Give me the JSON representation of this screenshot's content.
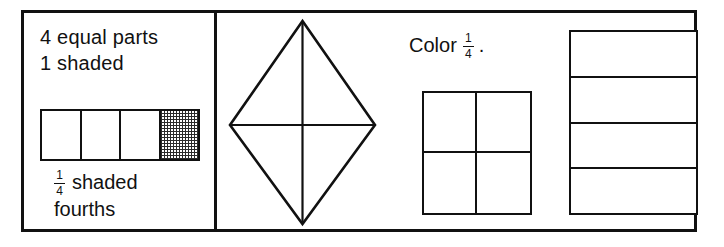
{
  "worksheet": {
    "title": "Fractions worksheet: fourths",
    "ink_color": "#111111",
    "paper_color": "#ffffff"
  },
  "example_panel": {
    "caption_equal_parts": "4 equal parts",
    "caption_shaded_count": "1 shaded",
    "shaded_label_text": "shaded",
    "fourths_label": "fourths",
    "fraction": {
      "numerator": "1",
      "denominator": "4"
    },
    "fraction_bar": {
      "total_parts": 4,
      "shaded_parts": 1,
      "cells": [
        {
          "index": 1,
          "shaded": false
        },
        {
          "index": 2,
          "shaded": false
        },
        {
          "index": 3,
          "shaded": false
        },
        {
          "index": 4,
          "shaded": true
        }
      ]
    }
  },
  "exercise_panel": {
    "instruction_verb": "Color",
    "instruction_period": ".",
    "instruction_fraction": {
      "numerator": "1",
      "denominator": "4"
    },
    "rhombus": {
      "parts": 4,
      "shaded_parts": 0,
      "divider_lines": [
        "vertical-diagonal",
        "horizontal-diagonal"
      ]
    },
    "grid_square": {
      "rows": 2,
      "columns": 2,
      "parts": 4,
      "shaded_parts": 0
    },
    "band_rectangle": {
      "rows": 4,
      "columns": 1,
      "parts": 4,
      "shaded_parts": 0
    }
  }
}
